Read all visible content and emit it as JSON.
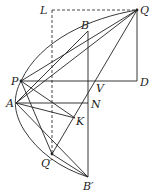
{
  "figure": {
    "type": "geometry-diagram"
  },
  "points": {
    "L": {
      "label": "L"
    },
    "Q": {
      "label": "Q"
    },
    "B": {
      "label": "B"
    },
    "P": {
      "label": "P"
    },
    "D": {
      "label": "D"
    },
    "V": {
      "label": "V"
    },
    "A": {
      "label": "A"
    },
    "N": {
      "label": "N"
    },
    "K": {
      "label": "K"
    },
    "Qp": {
      "label": "Q′"
    },
    "Bp": {
      "label": "B′"
    }
  },
  "segments": [
    {
      "from": "L",
      "to": "Q",
      "style": "dashed"
    },
    {
      "from": "L",
      "to": "Qp",
      "style": "dashed"
    },
    {
      "from": "Q",
      "to": "D",
      "style": "solid"
    },
    {
      "from": "P",
      "to": "D",
      "style": "solid"
    },
    {
      "from": "A",
      "to": "N",
      "style": "solid"
    },
    {
      "from": "B",
      "to": "Bp",
      "style": "solid"
    },
    {
      "from": "P",
      "to": "Q",
      "style": "solid"
    },
    {
      "from": "A",
      "to": "Q",
      "style": "solid"
    },
    {
      "from": "A",
      "to": "B",
      "style": "solid"
    },
    {
      "from": "Q",
      "to": "Qp",
      "style": "solid"
    },
    {
      "from": "P",
      "to": "K",
      "style": "solid"
    },
    {
      "from": "P",
      "to": "Bp",
      "style": "solid"
    },
    {
      "from": "A",
      "to": "Bp",
      "style": "solid"
    },
    {
      "from": "A",
      "to": "K",
      "style": "solid"
    },
    {
      "from": "P",
      "to": "Qp",
      "style": "solid"
    }
  ],
  "curves": [
    {
      "name": "parabola-arc",
      "through": [
        "Q",
        "B",
        "P",
        "A",
        "Qp",
        "Bp"
      ]
    }
  ]
}
